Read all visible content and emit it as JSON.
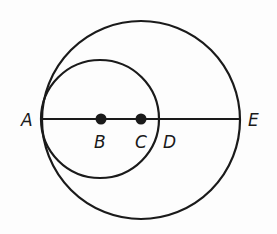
{
  "diagram": {
    "type": "geometry",
    "colors": {
      "stroke": "#1a1a1a",
      "background": "#fdfdfd"
    },
    "line": {
      "from": "A",
      "to": "E",
      "x1": 41,
      "y1": 119,
      "x2": 241,
      "y2": 119
    },
    "circles": [
      {
        "name": "large-circle",
        "center": "C",
        "cx": 141,
        "cy": 120,
        "r": 100
      },
      {
        "name": "small-circle",
        "center": "B",
        "cx": 100,
        "cy": 119,
        "r": 59
      }
    ],
    "points": [
      {
        "label": "A",
        "x": 41,
        "y": 119,
        "label_x": 22,
        "label_y": 126,
        "dot": false
      },
      {
        "label": "B",
        "x": 101,
        "y": 119,
        "label_x": 95,
        "label_y": 147,
        "dot": true
      },
      {
        "label": "C",
        "x": 141,
        "y": 119,
        "label_x": 136,
        "label_y": 147,
        "dot": true
      },
      {
        "label": "D",
        "x": 159,
        "y": 119,
        "label_x": 163,
        "label_y": 147,
        "dot": false
      },
      {
        "label": "E",
        "x": 241,
        "y": 119,
        "label_x": 249,
        "label_y": 126,
        "dot": false
      }
    ]
  }
}
